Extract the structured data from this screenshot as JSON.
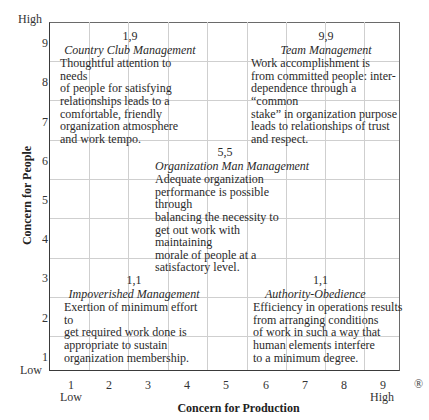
{
  "y_axis": {
    "title": "Concern for People",
    "ticks": [
      "9",
      "8",
      "7",
      "6",
      "5",
      "4",
      "3",
      "2",
      "1"
    ],
    "high_label": "High",
    "low_label": "Low"
  },
  "x_axis": {
    "title": "Concern for Production",
    "ticks": [
      "1",
      "2",
      "3",
      "4",
      "5",
      "6",
      "7",
      "8",
      "9"
    ],
    "low_label": "Low",
    "high_label": "High"
  },
  "registered_mark": "®",
  "styles": {
    "country_club": {
      "coord": "1,9",
      "name": "Country Club Management",
      "desc": "Thoughtful attention to needs\nof people for satisfying\nrelationships leads to a\ncomfortable, friendly\norganization atmosphere\nand work tempo."
    },
    "team": {
      "coord": "9,9",
      "name": "Team Management",
      "desc": "Work accomplishment is\nfrom committed people: inter-\ndependence through a “common\nstake” in organization purpose\nleads to relationships of trust\nand respect."
    },
    "organization_man": {
      "coord": "5,5",
      "name": "Organization Man Management",
      "desc": "Adequate organization\nperformance is possible through\nbalancing the necessity to\nget out work with maintaining\nmorale of people at a\nsatisfactory level."
    },
    "impoverished": {
      "coord": "1,1",
      "name": "Impoverished Management",
      "desc": "Exertion of minimum effort to\nget required work done is\nappropriate to sustain\norganization membership."
    },
    "authority_obedience": {
      "coord": "1,1",
      "name": "Authority-Obedience",
      "desc": "Efficiency in operations results\nfrom arranging conditions\nof work in such a way that\nhuman elements interfere\nto a minimum degree."
    }
  },
  "colors": {
    "grid": "#cfcfcf",
    "axis": "#3a3a3a",
    "text": "#2a2a2a"
  }
}
